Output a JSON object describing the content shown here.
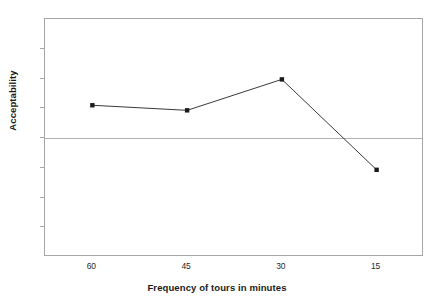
{
  "chart_data": {
    "type": "line",
    "title": "",
    "xlabel": "Frequency of tours in minutes",
    "ylabel": "Acceptability",
    "categories": [
      "60",
      "45",
      "30",
      "15"
    ],
    "x": [
      60,
      45,
      30,
      15
    ],
    "values": [
      1.1,
      0.93,
      1.97,
      -1.07
    ],
    "series": [
      {
        "name": "Acceptability",
        "values": [
          1.1,
          0.93,
          1.97,
          -1.07
        ],
        "color": "#3a3a3a",
        "marker": "square",
        "marker_color": "#1a1a1a"
      }
    ],
    "ylim": [
      -4,
      4
    ],
    "yticks": [
      "4",
      "3",
      "2",
      "1",
      "0",
      "-1",
      "-2",
      "-3",
      "-4"
    ],
    "ytick_values": [
      4,
      3,
      2,
      1,
      0,
      -1,
      -2,
      -3,
      -4
    ],
    "xticks": [
      "60",
      "45",
      "30",
      "15"
    ],
    "grid": false,
    "zero_line": true,
    "legend": "none",
    "plot_border_color": "#a6a6a6",
    "background_color": "#ffffff"
  },
  "axes": {
    "y_title": "Acceptability",
    "x_title": "Frequency of tours in minutes"
  }
}
